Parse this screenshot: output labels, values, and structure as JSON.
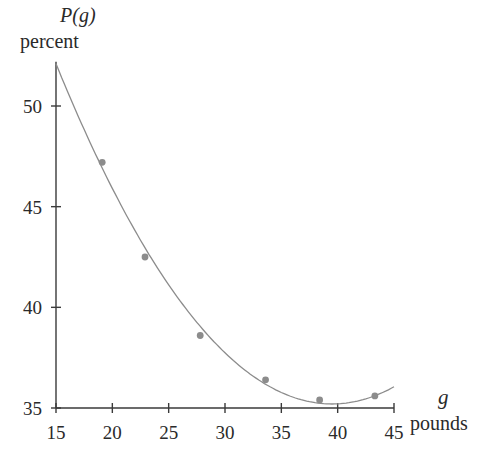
{
  "chart_data": {
    "type": "scatter",
    "title": "",
    "ylabel": "P(g)",
    "ylabel_unit": "percent",
    "xlabel": "g",
    "xlabel_unit": "pounds",
    "xlim": [
      15,
      45
    ],
    "ylim": [
      35,
      52
    ],
    "x_ticks": [
      15,
      20,
      25,
      30,
      35,
      40,
      45
    ],
    "y_ticks": [
      35,
      40,
      45,
      50
    ],
    "grid": false,
    "legend": null,
    "series": [
      {
        "name": "data points",
        "kind": "scatter",
        "x": [
          19.1,
          22.9,
          27.8,
          33.6,
          38.4,
          43.3
        ],
        "y": [
          47.2,
          42.5,
          38.6,
          36.4,
          35.4,
          35.6
        ],
        "color": "#8c8c8c"
      },
      {
        "name": "quadratic fit curve",
        "kind": "line",
        "x": [
          15,
          17.5,
          20,
          22.5,
          25,
          27.5,
          30,
          32.5,
          35,
          37.5,
          40,
          42.5,
          45
        ],
        "y": [
          52.1,
          49.1,
          46.4,
          43.9,
          41.7,
          39.8,
          38.2,
          36.9,
          35.9,
          35.3,
          35.2,
          35.4,
          36.3
        ],
        "color": "#8c8c8c"
      }
    ]
  },
  "labels": {
    "y_title": "P(g)",
    "y_unit": "percent",
    "x_title": "g",
    "x_unit": "pounds"
  }
}
